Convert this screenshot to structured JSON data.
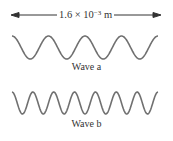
{
  "diagram": {
    "measurement": {
      "mantissa": "1.6 × 10",
      "exponent": "−3",
      "unit": " m",
      "arrow": "double-headed horizontal arrow spanning width"
    },
    "waves": [
      {
        "label": "Wave a",
        "cycles": 4,
        "color": "#707070"
      },
      {
        "label": "Wave b",
        "cycles": 7,
        "color": "#707070"
      }
    ]
  }
}
